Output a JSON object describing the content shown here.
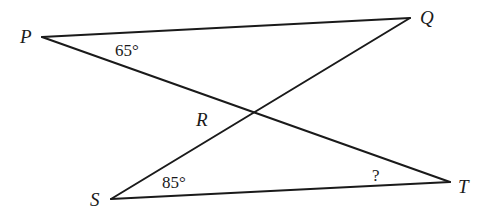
{
  "figure": {
    "type": "crossed-triangles",
    "vertices": {
      "P": {
        "label": "P",
        "x": 42,
        "y": 37
      },
      "Q": {
        "label": "Q",
        "x": 410,
        "y": 18
      },
      "S": {
        "label": "S",
        "x": 111,
        "y": 199
      },
      "T": {
        "label": "T",
        "x": 450,
        "y": 182
      },
      "R": {
        "label": "R",
        "x": 253,
        "y": 113
      }
    },
    "segments": [
      {
        "name": "PQ",
        "from": "P",
        "to": "Q"
      },
      {
        "name": "PT",
        "from": "P",
        "to": "T"
      },
      {
        "name": "QS",
        "from": "Q",
        "to": "S"
      },
      {
        "name": "ST",
        "from": "S",
        "to": "T"
      }
    ],
    "angles": {
      "P": {
        "vertex": "P",
        "label": "65°"
      },
      "S": {
        "vertex": "S",
        "label": "85°"
      },
      "T": {
        "vertex": "T",
        "label": "?"
      }
    },
    "colors": {
      "stroke": "#1a1a1a",
      "background": "#ffffff"
    }
  }
}
